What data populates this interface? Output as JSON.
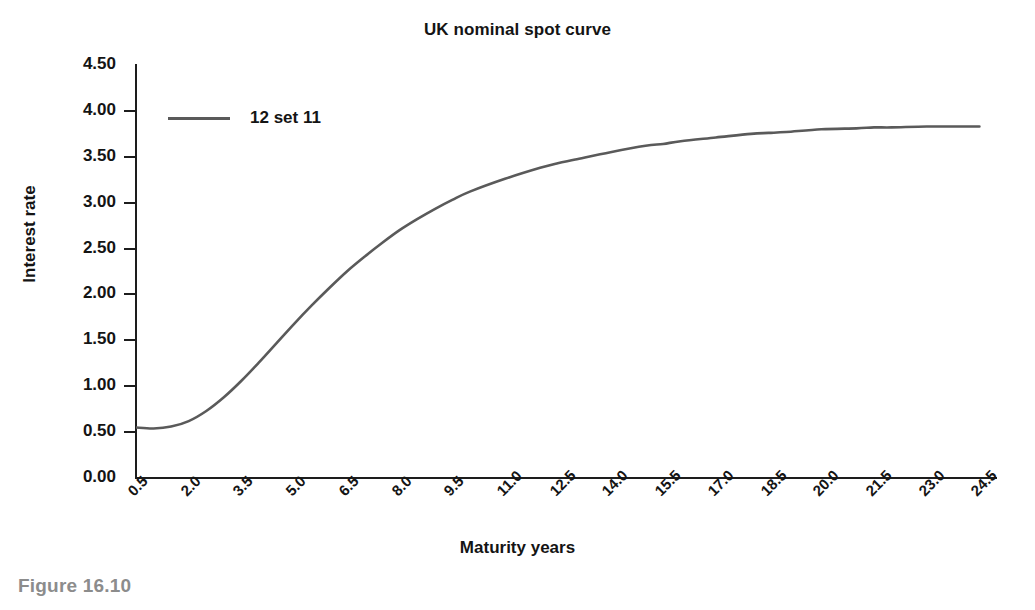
{
  "figure": {
    "caption": "Figure 16.10"
  },
  "chart_data": {
    "type": "line",
    "title": "UK nominal spot curve",
    "xlabel": "Maturity years",
    "ylabel": "Interest rate",
    "xlim": [
      0.5,
      25.0
    ],
    "ylim": [
      0.0,
      4.5
    ],
    "grid": false,
    "legend_position": "upper-left",
    "line_color": "#5a5a5a",
    "axis_color": "#1d1d1d",
    "categories": [
      "0.5",
      "2.0",
      "3.5",
      "5.0",
      "6.5",
      "8.0",
      "9.5",
      "11.0",
      "12.5",
      "14.0",
      "15.5",
      "17.0",
      "18.5",
      "20.0",
      "21.5",
      "23.0",
      "24.5"
    ],
    "yticks": [
      "0.00",
      "0.50",
      "1.00",
      "1.50",
      "2.00",
      "2.50",
      "3.00",
      "3.50",
      "4.00",
      "4.50"
    ],
    "series": [
      {
        "name": "12 set 11",
        "x": [
          0.5,
          1.0,
          1.5,
          2.0,
          2.5,
          3.0,
          3.5,
          4.0,
          4.5,
          5.0,
          5.5,
          6.0,
          6.5,
          7.0,
          7.5,
          8.0,
          8.5,
          9.0,
          9.5,
          10.0,
          11.0,
          12.0,
          12.5,
          13.0,
          14.0,
          15.0,
          15.5,
          16.0,
          17.0,
          18.0,
          18.5,
          19.0,
          20.0,
          21.0,
          21.5,
          22.0,
          23.0,
          24.0,
          24.5
        ],
        "values": [
          0.55,
          0.54,
          0.56,
          0.62,
          0.73,
          0.88,
          1.06,
          1.26,
          1.47,
          1.68,
          1.88,
          2.07,
          2.25,
          2.41,
          2.56,
          2.7,
          2.82,
          2.93,
          3.03,
          3.12,
          3.26,
          3.38,
          3.43,
          3.47,
          3.55,
          3.62,
          3.64,
          3.67,
          3.71,
          3.75,
          3.76,
          3.77,
          3.8,
          3.81,
          3.82,
          3.82,
          3.83,
          3.83,
          3.83
        ]
      }
    ]
  }
}
